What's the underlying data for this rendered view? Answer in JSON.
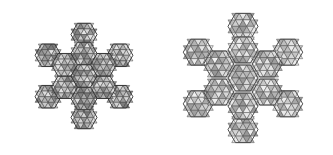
{
  "figures": [
    {
      "id": "left",
      "description": "Triangulated polyhedral cluster, compact (folded) state",
      "center": [
        84,
        76
      ],
      "hex_size": 13,
      "edge_color": "#3a3a3a",
      "fill_light": "#e6e6e6",
      "fill_dark": "#6a6a6a"
    },
    {
      "id": "right",
      "description": "Triangulated polyhedral cluster, expanded (unfolded) state",
      "center": [
        77,
        78
      ],
      "hex_size": 15,
      "edge_color": "#4a4a4a",
      "fill_light": "#f0f0f0",
      "fill_dark": "#8a8a8a"
    }
  ],
  "background": "#ffffff"
}
